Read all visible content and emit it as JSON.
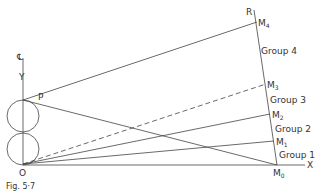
{
  "figure": {
    "caption": "Fig. 5·7",
    "points": {
      "O": {
        "label": "O",
        "x": 23,
        "y": 164
      },
      "P": {
        "label": "P",
        "x": 23,
        "y": 100
      },
      "M0": {
        "label": "M",
        "sub": "0",
        "x": 277,
        "y": 165
      },
      "M1": {
        "label": "M",
        "sub": "1",
        "x": 274,
        "y": 141
      },
      "M2": {
        "label": "M",
        "sub": "2",
        "x": 270,
        "y": 114
      },
      "M3": {
        "label": "M",
        "sub": "3",
        "x": 266,
        "y": 84
      },
      "M4": {
        "label": "M",
        "sub": "4",
        "x": 257,
        "y": 22
      }
    },
    "axes": {
      "x_label": "X",
      "y_label": "Y",
      "centerline_symbol": "℄",
      "r_label": "R"
    },
    "groups": [
      {
        "label": "Group 4"
      },
      {
        "label": "Group 3"
      },
      {
        "label": "Group 2"
      },
      {
        "label": "Group 1"
      }
    ]
  }
}
